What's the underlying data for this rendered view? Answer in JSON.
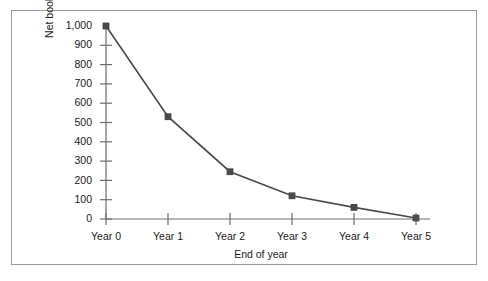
{
  "chart_data": {
    "type": "line",
    "title": "",
    "subtitle": "",
    "xlabel": "End of year",
    "ylabel": "Net book value (£)",
    "categories": [
      "Year 0",
      "Year 1",
      "Year 2",
      "Year 3",
      "Year 4",
      "Year 5"
    ],
    "values": [
      1000,
      530,
      245,
      120,
      60,
      5
    ],
    "series": [
      {
        "name": "Net book value",
        "values": [
          1000,
          530,
          245,
          120,
          60,
          5
        ]
      }
    ],
    "ylim": [
      0,
      1000
    ],
    "ytick_values": [
      0,
      100,
      200,
      300,
      400,
      500,
      600,
      700,
      800,
      900,
      1000
    ],
    "ytick_labels": [
      "0",
      "100",
      "200",
      "300",
      "400",
      "500",
      "600",
      "700",
      "800",
      "900",
      "1,000"
    ],
    "xtick_labels": [
      "Year 0",
      "Year 1",
      "Year 2",
      "Year 3",
      "Year 4",
      "Year 5"
    ],
    "grid": false,
    "legend": false,
    "legend_position": "none",
    "marker": "square",
    "line_color": "#4a4a4a",
    "marker_color": "#4a4a4a",
    "axis_color": "#6e6e6e",
    "frame_color": "#9a9a9a",
    "text_color": "#1a1a1a"
  }
}
